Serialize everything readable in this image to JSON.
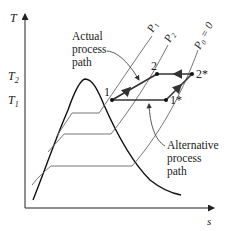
{
  "diagram": {
    "type": "T-s diagram",
    "axes": {
      "y_label": "T",
      "x_label": "s",
      "y_ticks": [
        {
          "label": "T",
          "sub": "2"
        },
        {
          "label": "T",
          "sub": "1"
        }
      ]
    },
    "isobars": [
      {
        "label": "P",
        "sub": "1",
        "suffix": ""
      },
      {
        "label": "P",
        "sub": "2",
        "suffix": ""
      },
      {
        "label": "P",
        "sub": "0",
        "suffix": " = 0"
      }
    ],
    "points": [
      {
        "id": "p1",
        "label": "1"
      },
      {
        "id": "p2",
        "label": "2"
      },
      {
        "id": "p1s",
        "label": "1*"
      },
      {
        "id": "p2s",
        "label": "2*"
      }
    ],
    "annotations": {
      "actual": [
        "Actual",
        "process",
        "path"
      ],
      "alternative": [
        "Alternative",
        "process",
        "path"
      ]
    }
  }
}
